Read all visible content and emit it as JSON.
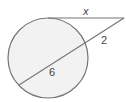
{
  "diagram": {
    "type": "circle-tangent-secant",
    "colors": {
      "background": "#ffffff",
      "circle_fill": "#f2f2f2",
      "stroke": "#777777",
      "label": "#444444"
    },
    "circle": {
      "cx": 48,
      "cy": 58,
      "r": 40
    },
    "external_point": {
      "x": 124,
      "y": 18
    },
    "tangent": {
      "from": {
        "x": 48,
        "y": 18
      },
      "to": {
        "x": 124,
        "y": 18
      },
      "label": "x"
    },
    "secant": {
      "from": {
        "x": 124,
        "y": 18
      },
      "entry": {
        "x": 85,
        "y": 42
      },
      "exit": {
        "x": 19,
        "y": 85
      },
      "external_label": "2",
      "internal_label": "6"
    },
    "labels": [
      {
        "id": "tangent",
        "text": "x",
        "x": 86,
        "y": 15
      },
      {
        "id": "secant-external",
        "text": "2",
        "x": 102,
        "y": 44
      },
      {
        "id": "secant-internal",
        "text": "6",
        "x": 50,
        "y": 76
      }
    ]
  }
}
